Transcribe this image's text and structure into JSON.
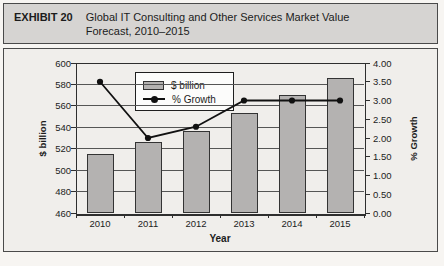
{
  "header": {
    "label": "EXHIBIT 20",
    "title": "Global IT Consulting and Other Services Market Value Forecast, 2010–2015"
  },
  "chart_data": {
    "type": "bar",
    "subtype": "bar-and-line-dual-axis",
    "categories": [
      "2010",
      "2011",
      "2012",
      "2013",
      "2014",
      "2015"
    ],
    "series": [
      {
        "name": "$ billion",
        "type": "bar",
        "axis": "left",
        "values": [
          515,
          526,
          537,
          553,
          570,
          586
        ]
      },
      {
        "name": "% Growth",
        "type": "line",
        "axis": "right",
        "values": [
          3.5,
          2.0,
          2.3,
          3.0,
          3.0,
          3.0
        ]
      }
    ],
    "title": "Global IT Consulting and Other Services Market Value Forecast, 2010–2015",
    "xlabel": "Year",
    "left_axis": {
      "label": "$ billion",
      "min": 460,
      "max": 600,
      "step": 20,
      "ticks": [
        "600",
        "580",
        "560",
        "540",
        "520",
        "500",
        "480",
        "460"
      ]
    },
    "right_axis": {
      "label": "% Growth",
      "min": 0,
      "max": 4,
      "step": 0.5,
      "ticks": [
        "4.00",
        "3.50",
        "3.00",
        "2.50",
        "2.00",
        "1.50",
        "1.00",
        "0.50",
        "0.00"
      ]
    },
    "legend": {
      "position": "top-center",
      "entries": [
        "$ billion",
        "% Growth"
      ]
    },
    "grid": true
  },
  "colors": {
    "header_bg": "#d6d4d2",
    "panel_bg": "#f0eeeb",
    "box_border": "#4a4a4a",
    "bar_fill": "#b4b2b1",
    "bar_border": "#333333",
    "line": "#111111",
    "gridline": "#555555",
    "text": "#1c1c1c"
  }
}
